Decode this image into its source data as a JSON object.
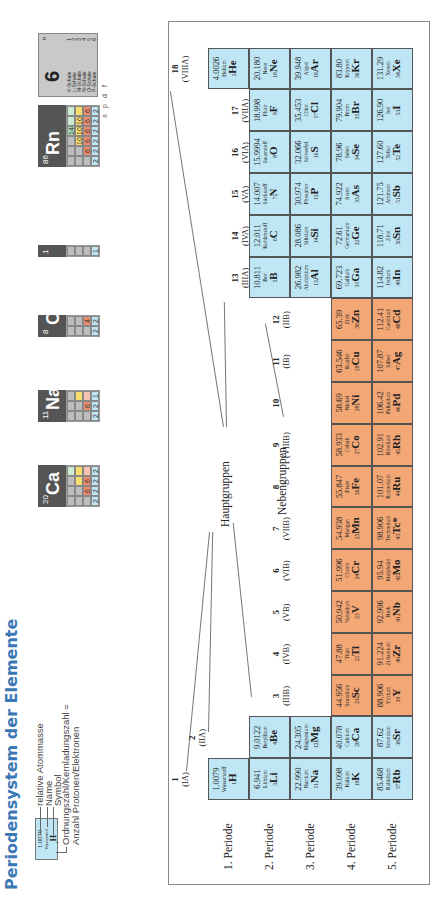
{
  "title": "Periodensystem der Elemente",
  "legend": {
    "sample": {
      "mass": "1.0079",
      "name": "Wasserstoff",
      "z": "1",
      "symbol": "H"
    },
    "labels": [
      "relative Atommasse",
      "Name",
      "Symbol"
    ],
    "z_label_line1": "Ordnungszahl/Kernladungszahl =",
    "z_label_line2": "Anzahl Protonen/Elektronen"
  },
  "shell_examples": [
    {
      "z": "1",
      "symbol": "H",
      "s": [
        "1"
      ],
      "p": [],
      "d": [],
      "f": []
    },
    {
      "z": "8",
      "symbol": "O",
      "s": [
        "2",
        "2"
      ],
      "p": [
        "4"
      ],
      "d": [],
      "f": []
    },
    {
      "z": "11",
      "symbol": "Na",
      "s": [
        "2",
        "2",
        "1"
      ],
      "p": [
        "6"
      ],
      "d": [],
      "f": []
    },
    {
      "z": "20",
      "symbol": "Ca",
      "s": [
        "2",
        "2",
        "2",
        "2"
      ],
      "p": [
        "6",
        "6"
      ],
      "d": [],
      "f": []
    },
    {
      "z": "86",
      "symbol": "Rn",
      "s": [
        "2",
        "2",
        "2",
        "2",
        "2",
        "2"
      ],
      "p": [
        "6",
        "6",
        "6",
        "6",
        "6"
      ],
      "d": [
        "10",
        "10",
        "10"
      ],
      "f": [
        "14"
      ]
    }
  ],
  "orbital_labels": [
    "s",
    "p",
    "d",
    "f"
  ],
  "shell_legend": {
    "number": "6",
    "n_label": "n",
    "shells": [
      {
        "name": "K-Schale",
        "n": "1"
      },
      {
        "name": "L-Schale",
        "n": "2"
      },
      {
        "name": "M-Schale",
        "n": "3"
      },
      {
        "name": "N-Schale",
        "n": "4"
      },
      {
        "name": "O-Schale",
        "n": "5"
      },
      {
        "name": "P-Schale",
        "n": "6"
      }
    ]
  },
  "group_labels": {
    "main": "Hauptgruppen",
    "sub": "Nebengruppen"
  },
  "periods": [
    "1. Periode",
    "2. Periode",
    "3. Periode",
    "4. Periode",
    "5. Periode"
  ],
  "groups": [
    {
      "n": "1",
      "roman": "(IA)"
    },
    {
      "n": "2",
      "roman": "(IIA)"
    },
    {
      "n": "3",
      "roman": "(IIIB)"
    },
    {
      "n": "4",
      "roman": "(IVB)"
    },
    {
      "n": "5",
      "roman": "(VB)"
    },
    {
      "n": "6",
      "roman": "(VIB)"
    },
    {
      "n": "7",
      "roman": "(VIIB)"
    },
    {
      "n": "8",
      "roman": ""
    },
    {
      "n": "9",
      "roman": "(VIIIB)"
    },
    {
      "n": "10",
      "roman": ""
    },
    {
      "n": "11",
      "roman": "(IB)"
    },
    {
      "n": "12",
      "roman": "(IIB)"
    },
    {
      "n": "13",
      "roman": "(IIIA)"
    },
    {
      "n": "14",
      "roman": "(IVA)"
    },
    {
      "n": "15",
      "roman": "(VA)"
    },
    {
      "n": "16",
      "roman": "(VIA)"
    },
    {
      "n": "17",
      "roman": "(VIIA)"
    },
    {
      "n": "18",
      "roman": "(VIIIA)"
    }
  ],
  "elements": [
    {
      "p": 1,
      "g": 1,
      "mass": "1.0079",
      "name": "Wasserstoff",
      "z": "1",
      "sym": "H",
      "t": "main"
    },
    {
      "p": 1,
      "g": 18,
      "mass": "4.0026",
      "name": "Helium",
      "z": "2",
      "sym": "He",
      "t": "main"
    },
    {
      "p": 2,
      "g": 1,
      "mass": "6.941",
      "name": "Lithium",
      "z": "3",
      "sym": "Li",
      "t": "main"
    },
    {
      "p": 2,
      "g": 2,
      "mass": "9.0122",
      "name": "Beryllium",
      "z": "4",
      "sym": "Be",
      "t": "main"
    },
    {
      "p": 2,
      "g": 13,
      "mass": "10.811",
      "name": "Bor",
      "z": "5",
      "sym": "B",
      "t": "main"
    },
    {
      "p": 2,
      "g": 14,
      "mass": "12.011",
      "name": "Kohlenstoff",
      "z": "6",
      "sym": "C",
      "t": "main"
    },
    {
      "p": 2,
      "g": 15,
      "mass": "14.007",
      "name": "Stickstoff",
      "z": "7",
      "sym": "N",
      "t": "main"
    },
    {
      "p": 2,
      "g": 16,
      "mass": "15.9994",
      "name": "Sauerstoff",
      "z": "8",
      "sym": "O",
      "t": "main"
    },
    {
      "p": 2,
      "g": 17,
      "mass": "18.998",
      "name": "Fluor",
      "z": "9",
      "sym": "F",
      "t": "main"
    },
    {
      "p": 2,
      "g": 18,
      "mass": "20.180",
      "name": "Neon",
      "z": "10",
      "sym": "Ne",
      "t": "main"
    },
    {
      "p": 3,
      "g": 1,
      "mass": "22.990",
      "name": "Natrium",
      "z": "11",
      "sym": "Na",
      "t": "main"
    },
    {
      "p": 3,
      "g": 2,
      "mass": "24.305",
      "name": "Magnesium",
      "z": "12",
      "sym": "Mg",
      "t": "main"
    },
    {
      "p": 3,
      "g": 13,
      "mass": "26.982",
      "name": "Aluminium",
      "z": "13",
      "sym": "Al",
      "t": "main"
    },
    {
      "p": 3,
      "g": 14,
      "mass": "28.086",
      "name": "Silicium",
      "z": "14",
      "sym": "Si",
      "t": "main"
    },
    {
      "p": 3,
      "g": 15,
      "mass": "30.974",
      "name": "Phosphor",
      "z": "15",
      "sym": "P",
      "t": "main"
    },
    {
      "p": 3,
      "g": 16,
      "mass": "32.066",
      "name": "Schwefel",
      "z": "16",
      "sym": "S",
      "t": "main"
    },
    {
      "p": 3,
      "g": 17,
      "mass": "35.453",
      "name": "Chlor",
      "z": "17",
      "sym": "Cl",
      "t": "main"
    },
    {
      "p": 3,
      "g": 18,
      "mass": "39.948",
      "name": "Argon",
      "z": "18",
      "sym": "Ar",
      "t": "main"
    },
    {
      "p": 4,
      "g": 1,
      "mass": "39.098",
      "name": "Kalium",
      "z": "19",
      "sym": "K",
      "t": "main"
    },
    {
      "p": 4,
      "g": 2,
      "mass": "40.078",
      "name": "Calcium",
      "z": "20",
      "sym": "Ca",
      "t": "main"
    },
    {
      "p": 4,
      "g": 3,
      "mass": "44.956",
      "name": "Scandium",
      "z": "21",
      "sym": "Sc",
      "t": "trans"
    },
    {
      "p": 4,
      "g": 4,
      "mass": "47.88",
      "name": "Titan",
      "z": "22",
      "sym": "Ti",
      "t": "trans"
    },
    {
      "p": 4,
      "g": 5,
      "mass": "50.942",
      "name": "Vanadium",
      "z": "23",
      "sym": "V",
      "t": "trans"
    },
    {
      "p": 4,
      "g": 6,
      "mass": "51.996",
      "name": "Chrom",
      "z": "24",
      "sym": "Cr",
      "t": "trans"
    },
    {
      "p": 4,
      "g": 7,
      "mass": "54.938",
      "name": "Mangan",
      "z": "25",
      "sym": "Mn",
      "t": "trans"
    },
    {
      "p": 4,
      "g": 8,
      "mass": "55.847",
      "name": "Eisen",
      "z": "26",
      "sym": "Fe",
      "t": "trans"
    },
    {
      "p": 4,
      "g": 9,
      "mass": "58.933",
      "name": "Cobalt",
      "z": "27",
      "sym": "Co",
      "t": "trans"
    },
    {
      "p": 4,
      "g": 10,
      "mass": "58.69",
      "name": "Nickel",
      "z": "28",
      "sym": "Ni",
      "t": "trans"
    },
    {
      "p": 4,
      "g": 11,
      "mass": "63.546",
      "name": "Kupfer",
      "z": "29",
      "sym": "Cu",
      "t": "trans"
    },
    {
      "p": 4,
      "g": 12,
      "mass": "65.39",
      "name": "Zink",
      "z": "30",
      "sym": "Zn",
      "t": "trans"
    },
    {
      "p": 4,
      "g": 13,
      "mass": "69.723",
      "name": "Gallium",
      "z": "31",
      "sym": "Ga",
      "t": "main"
    },
    {
      "p": 4,
      "g": 14,
      "mass": "72.61",
      "name": "Germanium",
      "z": "32",
      "sym": "Ge",
      "t": "main"
    },
    {
      "p": 4,
      "g": 15,
      "mass": "74.922",
      "name": "Arsen",
      "z": "33",
      "sym": "As",
      "t": "main"
    },
    {
      "p": 4,
      "g": 16,
      "mass": "78.96",
      "name": "Selen",
      "z": "34",
      "sym": "Se",
      "t": "main"
    },
    {
      "p": 4,
      "g": 17,
      "mass": "79.904",
      "name": "Brom",
      "z": "35",
      "sym": "Br",
      "t": "main"
    },
    {
      "p": 4,
      "g": 18,
      "mass": "83.80",
      "name": "Krypton",
      "z": "36",
      "sym": "Kr",
      "t": "main"
    },
    {
      "p": 5,
      "g": 1,
      "mass": "85.468",
      "name": "Rubidium",
      "z": "37",
      "sym": "Rb",
      "t": "main"
    },
    {
      "p": 5,
      "g": 2,
      "mass": "87.62",
      "name": "Strontium",
      "z": "38",
      "sym": "Sr",
      "t": "main"
    },
    {
      "p": 5,
      "g": 3,
      "mass": "88.906",
      "name": "Yttrium",
      "z": "39",
      "sym": "Y",
      "t": "trans"
    },
    {
      "p": 5,
      "g": 4,
      "mass": "91.224",
      "name": "Zirkonium",
      "z": "40",
      "sym": "Zr",
      "t": "trans"
    },
    {
      "p": 5,
      "g": 5,
      "mass": "92.906",
      "name": "Niob",
      "z": "41",
      "sym": "Nb",
      "t": "trans"
    },
    {
      "p": 5,
      "g": 6,
      "mass": "95.94",
      "name": "Molybdän",
      "z": "42",
      "sym": "Mo",
      "t": "trans"
    },
    {
      "p": 5,
      "g": 7,
      "mass": "98.906",
      "name": "Technetium",
      "z": "43",
      "sym": "Tc*",
      "t": "trans"
    },
    {
      "p": 5,
      "g": 8,
      "mass": "101.07",
      "name": "Ruthenium",
      "z": "44",
      "sym": "Ru",
      "t": "trans"
    },
    {
      "p": 5,
      "g": 9,
      "mass": "102.91",
      "name": "Rhodium",
      "z": "45",
      "sym": "Rh",
      "t": "trans"
    },
    {
      "p": 5,
      "g": 10,
      "mass": "106.42",
      "name": "Palladium",
      "z": "46",
      "sym": "Pd",
      "t": "trans"
    },
    {
      "p": 5,
      "g": 11,
      "mass": "107.87",
      "name": "Silber",
      "z": "47",
      "sym": "Ag",
      "t": "trans"
    },
    {
      "p": 5,
      "g": 12,
      "mass": "112.41",
      "name": "Cadmium",
      "z": "48",
      "sym": "Cd",
      "t": "trans"
    },
    {
      "p": 5,
      "g": 13,
      "mass": "114.82",
      "name": "Indium",
      "z": "49",
      "sym": "In",
      "t": "main"
    },
    {
      "p": 5,
      "g": 14,
      "mass": "118.71",
      "name": "Zinn",
      "z": "50",
      "sym": "Sn",
      "t": "main"
    },
    {
      "p": 5,
      "g": 15,
      "mass": "121.75",
      "name": "Antimon",
      "z": "51",
      "sym": "Sb",
      "t": "main"
    },
    {
      "p": 5,
      "g": 16,
      "mass": "127.60",
      "name": "Tellur",
      "z": "52",
      "sym": "Te",
      "t": "main"
    },
    {
      "p": 5,
      "g": 17,
      "mass": "126.90",
      "name": "Iod",
      "z": "53",
      "sym": "I",
      "t": "main"
    },
    {
      "p": 5,
      "g": 18,
      "mass": "131.29",
      "name": "Xenon",
      "z": "54",
      "sym": "Xe",
      "t": "main"
    }
  ],
  "colors": {
    "main": "#bfe6f4",
    "transition": "#f3a775",
    "title": "#3a78b5"
  }
}
